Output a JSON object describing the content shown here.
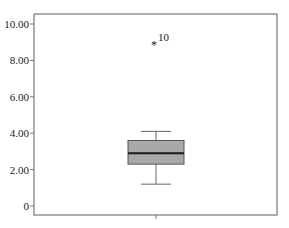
{
  "chart_data": {
    "type": "box",
    "title": "",
    "xlabel": "",
    "ylabel": "",
    "ylim": [
      -0.5,
      10.5
    ],
    "y_ticks": [
      0,
      2,
      4,
      6,
      8,
      10
    ],
    "y_tick_labels": [
      "0",
      "2.00",
      "4.00",
      "6.00",
      "8.00",
      "10.00"
    ],
    "grid": false,
    "categories": [
      ""
    ],
    "series": [
      {
        "name": "",
        "whisker_low": 1.2,
        "q1": 2.3,
        "median": 2.9,
        "q3": 3.6,
        "whisker_high": 4.1,
        "outliers": [
          {
            "value": 8.9,
            "label": "10",
            "marker": "*"
          }
        ]
      }
    ],
    "colors": {
      "box_fill": "#a9a9a9",
      "box_edge": "#555555",
      "median": "#1a1a1a",
      "frame": "#777777"
    }
  }
}
